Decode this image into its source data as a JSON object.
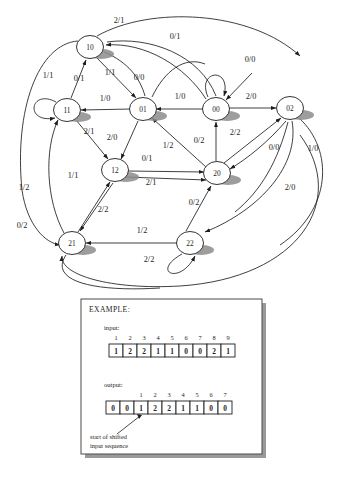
{
  "figure": {
    "type": "state-transition-diagram",
    "machine": "Mealy finite state machine",
    "label_format": "input/output",
    "states": [
      {
        "id": "10",
        "label": "10",
        "cx": 90,
        "cy": 47
      },
      {
        "id": "11",
        "label": "11",
        "cx": 67,
        "cy": 110
      },
      {
        "id": "01",
        "label": "01",
        "cx": 143,
        "cy": 109
      },
      {
        "id": "00",
        "label": "00",
        "cx": 216,
        "cy": 109
      },
      {
        "id": "02",
        "label": "02",
        "cx": 290,
        "cy": 108
      },
      {
        "id": "12",
        "label": "12",
        "cx": 115,
        "cy": 170
      },
      {
        "id": "20",
        "label": "20",
        "cx": 217,
        "cy": 173
      },
      {
        "id": "21",
        "label": "21",
        "cx": 72,
        "cy": 243
      },
      {
        "id": "22",
        "label": "22",
        "cx": 190,
        "cy": 243
      }
    ],
    "edge_labels": [
      {
        "id": "e-top-21",
        "text": "2/1",
        "x": 119,
        "y": 23
      },
      {
        "id": "e-01-top",
        "text": "0/1",
        "x": 175,
        "y": 39
      },
      {
        "id": "e-00-loop",
        "text": "0/0",
        "x": 250,
        "y": 62
      },
      {
        "id": "e-11-loop",
        "text": "1/1",
        "x": 48,
        "y": 78
      },
      {
        "id": "e-11-10",
        "text": "0/1",
        "x": 79,
        "y": 81
      },
      {
        "id": "e-10-01a",
        "text": "1/1",
        "x": 110,
        "y": 75
      },
      {
        "id": "e-10-01b",
        "text": "0/0",
        "x": 139,
        "y": 80
      },
      {
        "id": "e-01-11",
        "text": "1/0",
        "x": 105,
        "y": 101
      },
      {
        "id": "e-00-01",
        "text": "1/0",
        "x": 180,
        "y": 99
      },
      {
        "id": "e-00-02",
        "text": "2/0",
        "x": 251,
        "y": 99
      },
      {
        "id": "e-11-12",
        "text": "2/1",
        "x": 89,
        "y": 134
      },
      {
        "id": "e-01-12",
        "text": "2/0",
        "x": 112,
        "y": 140
      },
      {
        "id": "e-20-01",
        "text": "1/2",
        "x": 168,
        "y": 148
      },
      {
        "id": "e-20-00",
        "text": "0/2",
        "x": 199,
        "y": 143
      },
      {
        "id": "e-20-02",
        "text": "2/2",
        "x": 235,
        "y": 135
      },
      {
        "id": "e-02-20",
        "text": "0/0",
        "x": 274,
        "y": 150
      },
      {
        "id": "e-far-10",
        "text": "1/0",
        "x": 313,
        "y": 151
      },
      {
        "id": "e-12-20",
        "text": "0/1",
        "x": 147,
        "y": 161
      },
      {
        "id": "e-21-12",
        "text": "1/1",
        "x": 73,
        "y": 178
      },
      {
        "id": "e-12-22",
        "text": "2/1",
        "x": 151,
        "y": 185
      },
      {
        "id": "e-left-12",
        "text": "1/2",
        "x": 24,
        "y": 190
      },
      {
        "id": "e-22-20",
        "text": "0/2",
        "x": 194,
        "y": 205
      },
      {
        "id": "e-12-21",
        "text": "2/2",
        "x": 103,
        "y": 212
      },
      {
        "id": "e-far-20",
        "text": "2/0",
        "x": 290,
        "y": 190
      },
      {
        "id": "e-left-21",
        "text": "0/2",
        "x": 22,
        "y": 228
      },
      {
        "id": "e-22-21",
        "text": "1/2",
        "x": 142,
        "y": 233
      },
      {
        "id": "e-22-loop",
        "text": "2/2",
        "x": 149,
        "y": 262
      }
    ]
  },
  "example": {
    "title": "EXAMPLE:",
    "input_label": "input:",
    "output_label": "output:",
    "input_indices": [
      "1",
      "2",
      "3",
      "4",
      "5",
      "6",
      "7",
      "8",
      "9"
    ],
    "input_values": [
      "1",
      "2",
      "2",
      "1",
      "1",
      "0",
      "0",
      "2",
      "1"
    ],
    "output_indices": [
      "1",
      "2",
      "3",
      "4",
      "5",
      "6",
      "7"
    ],
    "output_values": [
      "0",
      "0",
      "1",
      "2",
      "2",
      "1",
      "1",
      "0",
      "0"
    ],
    "caption_line1": "start of shifted",
    "caption_line2": "input sequence"
  },
  "colors": {
    "ink": "#1d1d1d",
    "shadow": "#8a8a8a",
    "box_border": "#4a4a4a",
    "box_shadow": "#9a9a9a",
    "paper": "#ffffff"
  }
}
